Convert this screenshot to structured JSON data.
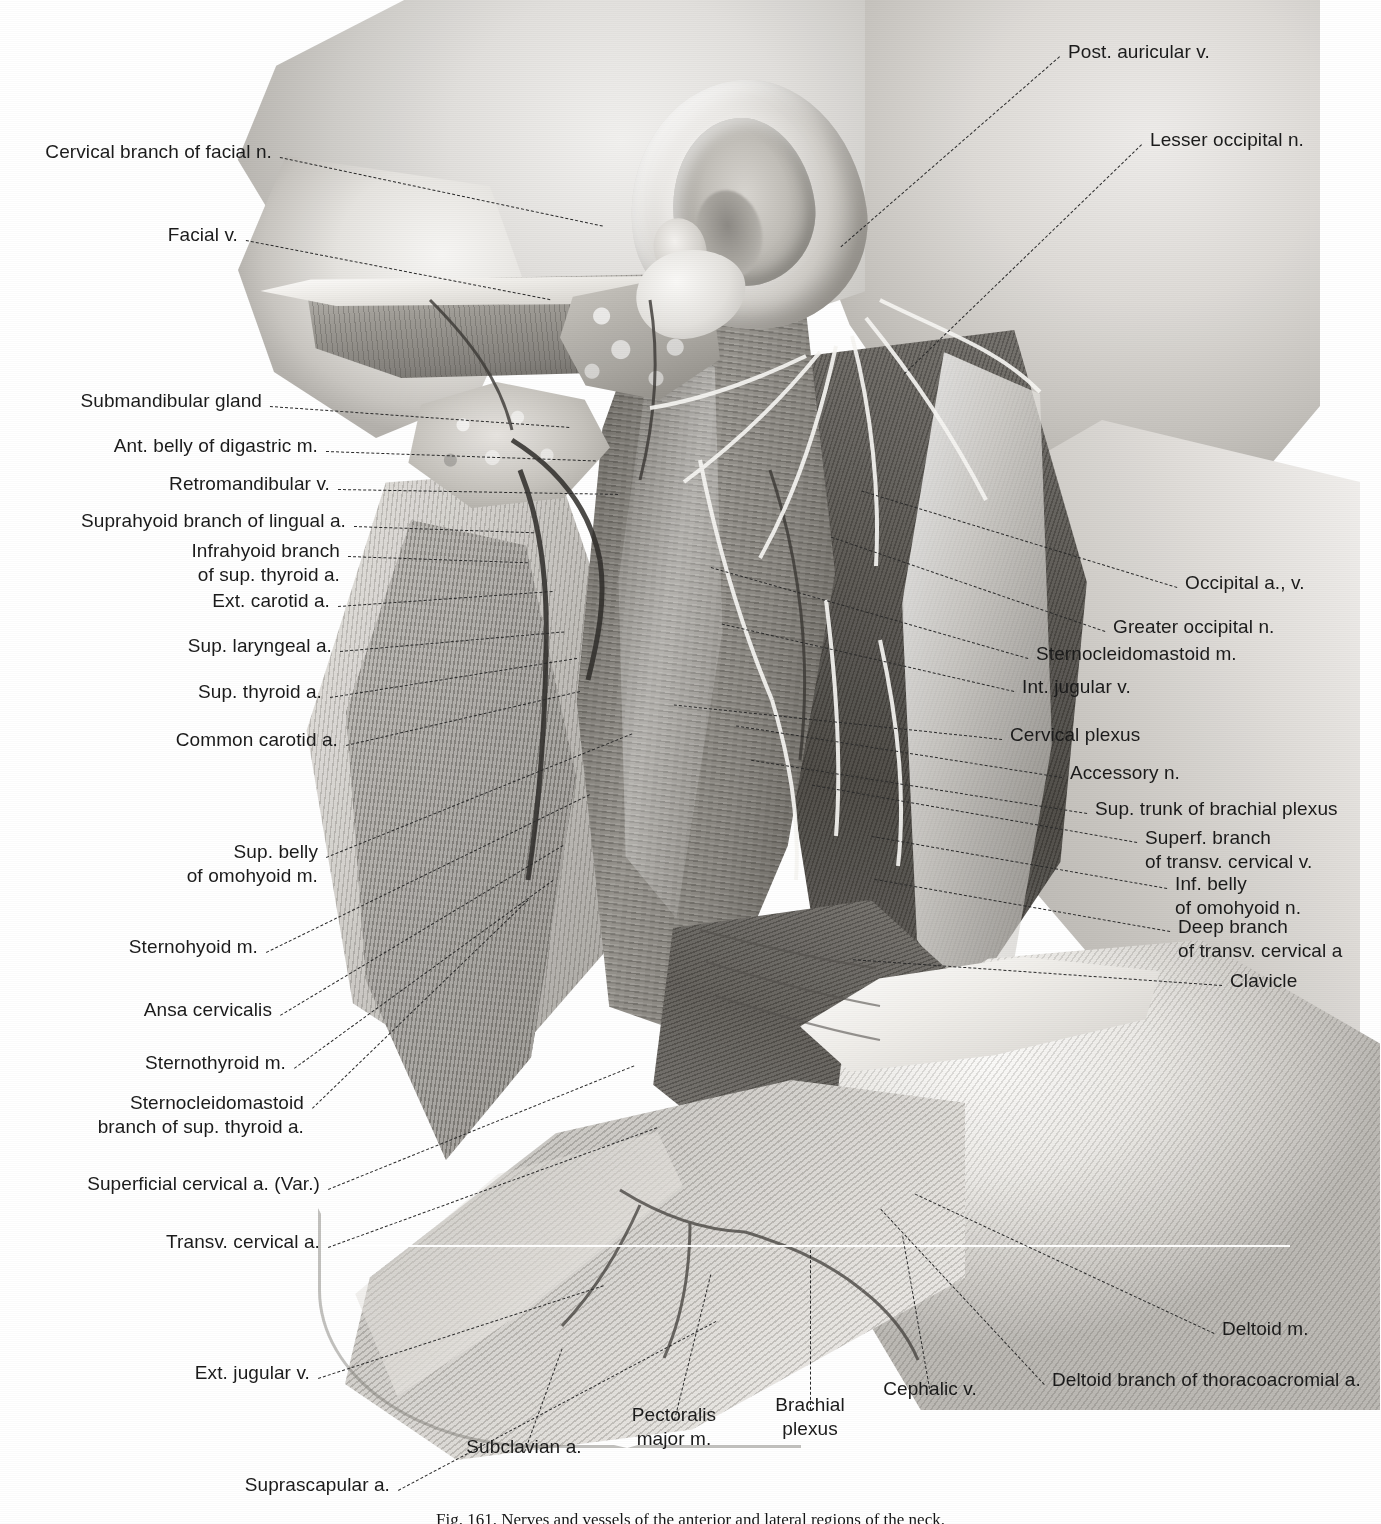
{
  "figure": {
    "caption": "Fig. 161.  Nerves and vessels of the anterior and lateral regions of the neck.",
    "scanline_artifact": true,
    "palette": {
      "background": "#ffffff",
      "ink": "#1b1b1b",
      "leader": "#2a2a2a",
      "tone_light": "#efedea",
      "tone_mid": "#9b9892",
      "tone_dark": "#47443f"
    }
  },
  "labels_left": [
    {
      "id": "cervical-branch-facial-n",
      "text": "Cervical branch of facial n.",
      "x": 272,
      "y": 157,
      "lead": {
        "len": 330,
        "angle": 12
      }
    },
    {
      "id": "facial-v",
      "text": "Facial v.",
      "x": 238,
      "y": 240,
      "lead": {
        "len": 310,
        "angle": 11
      }
    },
    {
      "id": "submandibular-gland",
      "text": "Submandibular gland",
      "x": 262,
      "y": 406,
      "lead": {
        "len": 300,
        "angle": 4
      }
    },
    {
      "id": "ant-belly-digastric-m",
      "text": "Ant. belly of digastric m.",
      "x": 318,
      "y": 451,
      "lead": {
        "len": 270,
        "angle": 2
      }
    },
    {
      "id": "retromandibular-v",
      "text": "Retromandibular v.",
      "x": 330,
      "y": 489,
      "lead": {
        "len": 280,
        "angle": 1
      }
    },
    {
      "id": "suprahyoid-branch-lingual-a",
      "text": "Suprahyoid branch of lingual a.",
      "x": 346,
      "y": 526,
      "lead": {
        "len": 180,
        "angle": 2
      }
    },
    {
      "id": "infrahyoid-branch-sup-thyroid-a",
      "text": "Infrahyoid branch\nof sup. thyroid a.",
      "x": 340,
      "y": 556,
      "lead": {
        "len": 180,
        "angle": 2
      }
    },
    {
      "id": "ext-carotid-a",
      "text": "Ext. carotid a.",
      "x": 330,
      "y": 606,
      "lead": {
        "len": 215,
        "angle": -4
      }
    },
    {
      "id": "sup-laryngeal-a",
      "text": "Sup. laryngeal a.",
      "x": 332,
      "y": 651,
      "lead": {
        "len": 225,
        "angle": -5
      }
    },
    {
      "id": "sup-thyroid-a",
      "text": "Sup. thyroid a.",
      "x": 322,
      "y": 697,
      "lead": {
        "len": 250,
        "angle": -9
      }
    },
    {
      "id": "common-carotid-a",
      "text": "Common carotid a.",
      "x": 338,
      "y": 745,
      "lead": {
        "len": 240,
        "angle": -13
      }
    },
    {
      "id": "sup-belly-omohyoid-m",
      "text": "Sup. belly\nof omohyoid m.",
      "x": 318,
      "y": 857,
      "lead": {
        "len": 330,
        "angle": -22
      }
    },
    {
      "id": "sternohyoid-m",
      "text": "Sternohyoid m.",
      "x": 258,
      "y": 952,
      "lead": {
        "len": 360,
        "angle": -26
      }
    },
    {
      "id": "ansa-cervicalis",
      "text": "Ansa cervicalis",
      "x": 272,
      "y": 1015,
      "lead": {
        "len": 330,
        "angle": -31
      }
    },
    {
      "id": "sternothyroid-m",
      "text": "Sternothyroid m.",
      "x": 286,
      "y": 1068,
      "lead": {
        "len": 320,
        "angle": -36
      }
    },
    {
      "id": "sternocleidomastoid-branch-sup-thyroid-a",
      "text": "Sternocleidomastoid\nbranch of sup. thyroid a.",
      "x": 304,
      "y": 1108,
      "lead": {
        "len": 300,
        "angle": -44
      }
    },
    {
      "id": "superficial-cervical-a-var",
      "text": "Superficial cervical a. (Var.)",
      "x": 320,
      "y": 1189,
      "lead": {
        "len": 330,
        "angle": -22
      }
    },
    {
      "id": "transv-cervical-a",
      "text": "Transv. cervical a.",
      "x": 320,
      "y": 1247,
      "lead": {
        "len": 350,
        "angle": -20
      }
    },
    {
      "id": "ext-jugular-v",
      "text": "Ext. jugular v.",
      "x": 310,
      "y": 1378,
      "lead": {
        "len": 300,
        "angle": -18
      }
    },
    {
      "id": "suprascapular-a",
      "text": "Suprascapular a.",
      "x": 390,
      "y": 1490,
      "lead": {
        "len": 360,
        "angle": -28
      }
    }
  ],
  "labels_right": [
    {
      "id": "post-auricular-v",
      "text": "Post. auricular v.",
      "x": 1068,
      "y": 57,
      "lead": {
        "len": 290,
        "angle": 139
      }
    },
    {
      "id": "lesser-occipital-n",
      "text": "Lesser occipital n.",
      "x": 1150,
      "y": 145,
      "lead": {
        "len": 330,
        "angle": 136
      }
    },
    {
      "id": "occipital-a-v",
      "text": "Occipital a., v.",
      "x": 1185,
      "y": 588,
      "lead": {
        "len": 330,
        "angle": 197
      }
    },
    {
      "id": "greater-occipital-n",
      "text": "Greater occipital n.",
      "x": 1113,
      "y": 632,
      "lead": {
        "len": 290,
        "angle": 199
      }
    },
    {
      "id": "sternocleidomastoid-m",
      "text": "Sternocleidomastoid m.",
      "x": 1036,
      "y": 659,
      "lead": {
        "len": 330,
        "angle": 196
      }
    },
    {
      "id": "int-jugular-v",
      "text": "Int. jugular v.",
      "x": 1022,
      "y": 692,
      "lead": {
        "len": 300,
        "angle": 193
      }
    },
    {
      "id": "cervical-plexus",
      "text": "Cervical plexus",
      "x": 1010,
      "y": 740,
      "lead": {
        "len": 330,
        "angle": 186
      }
    },
    {
      "id": "accessory-n",
      "text": "Accessory n.",
      "x": 1070,
      "y": 778,
      "lead": {
        "len": 330,
        "angle": 189
      }
    },
    {
      "id": "sup-trunk-brachial-plexus",
      "text": "Sup. trunk of brachial plexus",
      "x": 1095,
      "y": 814,
      "lead": {
        "len": 340,
        "angle": 189
      }
    },
    {
      "id": "superf-branch-transv-cervical-v",
      "text": "Superf. branch\nof transv. cervical v.",
      "x": 1145,
      "y": 843,
      "lead": {
        "len": 330,
        "angle": 190
      }
    },
    {
      "id": "inf-belly-omohyoid-n",
      "text": "Inf. belly\nof omohyoid n.",
      "x": 1175,
      "y": 889,
      "lead": {
        "len": 300,
        "angle": 190
      }
    },
    {
      "id": "deep-branch-transv-cervical-a",
      "text": "Deep branch\nof transv. cervical a",
      "x": 1178,
      "y": 932,
      "lead": {
        "len": 300,
        "angle": 190
      },
      "clipped_at_edge": true
    },
    {
      "id": "clavicle",
      "text": "Clavicle",
      "x": 1230,
      "y": 986,
      "lead": {
        "len": 370,
        "angle": 184
      }
    },
    {
      "id": "deltoid-m",
      "text": "Deltoid m.",
      "x": 1222,
      "y": 1334,
      "lead": {
        "len": 330,
        "angle": 205
      }
    },
    {
      "id": "deltoid-branch-thoracoacromial-a",
      "text": "Deltoid branch of thoracoacromial a.",
      "x": 1052,
      "y": 1385,
      "lead": {
        "len": 240,
        "angle": 227
      }
    }
  ],
  "labels_bottom": [
    {
      "id": "subclavian-a",
      "text": "Subclavian a.",
      "x": 524,
      "y": 1452,
      "lead": {
        "len": 110,
        "angle": -70
      }
    },
    {
      "id": "pectoralis-major-m",
      "text": "Pectoralis\nmajor m.",
      "x": 674,
      "y": 1420,
      "lead": {
        "len": 150,
        "angle": -76
      }
    },
    {
      "id": "brachial-plexus",
      "text": "Brachial\nplexus",
      "x": 810,
      "y": 1410,
      "lead": {
        "len": 160,
        "angle": -90
      }
    },
    {
      "id": "cephalic-v",
      "text": "Cephalic v.",
      "x": 930,
      "y": 1394,
      "lead": {
        "len": 160,
        "angle": -100
      }
    }
  ]
}
